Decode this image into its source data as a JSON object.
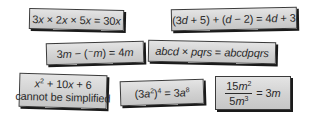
{
  "cards": [
    {
      "id": "card-1",
      "statement": "3x × 2x × 5x = 30x",
      "parts": [
        "3",
        "x",
        " × 2",
        "x",
        " × 5",
        "x",
        " = 30",
        "x"
      ]
    },
    {
      "id": "card-2",
      "statement": "(3d + 5) + (d − 2) = 4d + 3",
      "parts": [
        "(3",
        "d",
        " + 5) + (",
        "d",
        " − 2) = 4",
        "d",
        " + 3"
      ]
    },
    {
      "id": "card-3",
      "statement": "3m − (⁻m) = 4m",
      "parts": [
        "3",
        "m",
        " − (⁻",
        "m",
        ") = 4",
        "m"
      ]
    },
    {
      "id": "card-4",
      "statement": "abcd × pqrs = abcdpqrs",
      "parts": [
        "abcd",
        " × ",
        "pqrs",
        " = ",
        "abcdpqrs"
      ]
    },
    {
      "id": "card-5",
      "statement": "x² + 10x + 6 cannot be simplified",
      "line1_parts": [
        "x",
        "2",
        " + 10",
        "x",
        " + 6"
      ],
      "line2": "cannot be simplified"
    },
    {
      "id": "card-6",
      "statement": "(3a²)⁴ = 3a⁸",
      "parts": [
        "(3",
        "a",
        "2",
        ")",
        "4",
        " = 3",
        "a",
        "8"
      ]
    },
    {
      "id": "card-7",
      "statement": "15m² / 5m³ = 3m",
      "numerator": [
        "15",
        "m",
        "2"
      ],
      "denominator": [
        "5",
        "m",
        "3"
      ],
      "rhs": [
        " = 3",
        "m"
      ]
    }
  ]
}
